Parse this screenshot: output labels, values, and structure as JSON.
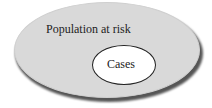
{
  "diagram": {
    "outer_set": {
      "label": "Population at risk",
      "fill": "#d9d9d9"
    },
    "inner_set": {
      "label": "Cases",
      "fill": "#ffffff",
      "stroke": "#222222"
    }
  }
}
